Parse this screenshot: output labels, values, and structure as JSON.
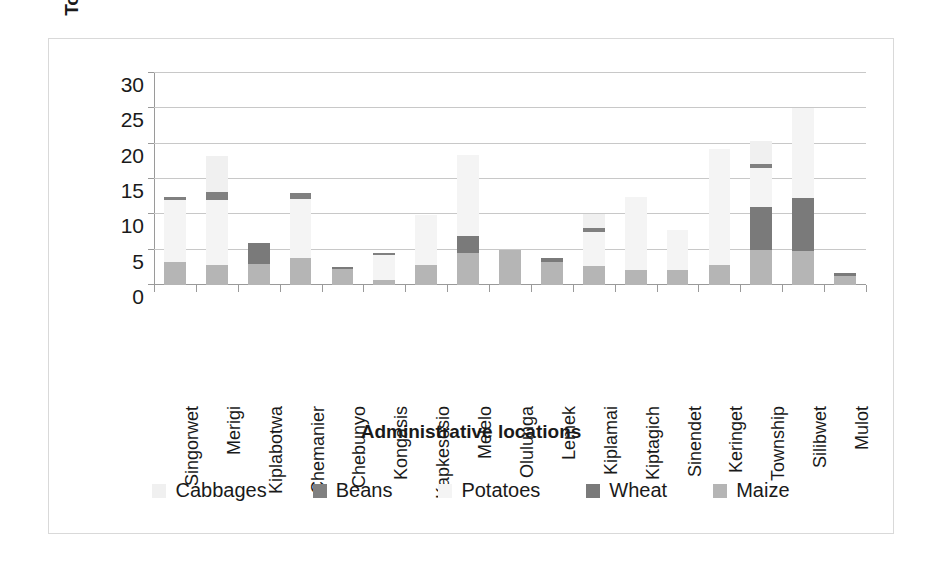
{
  "axes": {
    "y_title": "Total production, ton/Ha",
    "x_title": "Administrative locations",
    "y_ticks": [
      "0",
      "5",
      "10",
      "15",
      "20",
      "25",
      "30"
    ]
  },
  "legend": {
    "items": [
      {
        "label": "Cabbages",
        "color": "#f0f0f0",
        "swatch_name": "legend-swatch-cabbages"
      },
      {
        "label": "Beans",
        "color": "#808080",
        "swatch_name": "legend-swatch-beans"
      },
      {
        "label": "Potatoes",
        "color": "#f4f4f4",
        "swatch_name": "legend-swatch-potatoes"
      },
      {
        "label": "Wheat",
        "color": "#7a7a7a",
        "swatch_name": "legend-swatch-wheat"
      },
      {
        "label": "Maize",
        "color": "#b5b5b5",
        "swatch_name": "legend-swatch-maize"
      }
    ]
  },
  "chart_data": {
    "type": "bar",
    "stacked": true,
    "title": "",
    "xlabel": "Administrative locations",
    "ylabel": "Total production, ton/Ha",
    "ylim": [
      0,
      30
    ],
    "ytick_step": 5,
    "grid": true,
    "legend_position": "bottom",
    "categories": [
      "Singorwet",
      "Merigi",
      "Kiplabotwa",
      "Chemanier",
      "Chebunyo",
      "Kongasis",
      "Kapkesosio",
      "Melelo",
      "Olulunga",
      "Lemek",
      "Kiplamai",
      "Kiptagich",
      "Sinendet",
      "Keringet",
      "Township",
      "Silibwet",
      "Mulot"
    ],
    "series": [
      {
        "name": "Maize",
        "color": "#b5b5b5",
        "values": [
          3.2,
          2.9,
          3.0,
          3.8,
          2.3,
          0.7,
          2.8,
          4.5,
          4.9,
          3.2,
          2.7,
          2.1,
          2.1,
          2.9,
          4.9,
          4.8,
          1.3
        ]
      },
      {
        "name": "Wheat",
        "color": "#7a7a7a",
        "values": [
          0.0,
          0.0,
          3.0,
          0.0,
          0.3,
          0.0,
          0.0,
          2.4,
          0.0,
          0.6,
          0.0,
          0.0,
          0.0,
          0.0,
          6.1,
          7.5,
          0.4
        ]
      },
      {
        "name": "Potatoes",
        "color": "#f4f4f4",
        "values": [
          8.8,
          9.2,
          0.0,
          8.4,
          0.0,
          3.5,
          7.1,
          11.5,
          0.0,
          0.0,
          4.8,
          10.4,
          5.7,
          16.4,
          5.5,
          12.8,
          0.0
        ]
      },
      {
        "name": "Beans",
        "color": "#808080",
        "values": [
          0.4,
          1.0,
          0.0,
          0.8,
          0.0,
          0.3,
          0.0,
          0.0,
          0.0,
          0.0,
          0.5,
          0.0,
          0.0,
          0.0,
          0.6,
          0.0,
          0.0
        ]
      },
      {
        "name": "Cabbages",
        "color": "#f0f0f0",
        "values": [
          0.0,
          5.2,
          0.0,
          0.0,
          0.0,
          0.0,
          0.0,
          0.0,
          0.0,
          0.0,
          2.0,
          0.0,
          0.0,
          0.0,
          3.3,
          0.0,
          0.0
        ]
      }
    ],
    "totals": [
      12.4,
      18.3,
      6.0,
      13.0,
      2.6,
      4.5,
      9.9,
      18.4,
      4.9,
      3.8,
      10.0,
      12.5,
      7.8,
      19.3,
      20.4,
      25.1,
      1.7
    ]
  }
}
